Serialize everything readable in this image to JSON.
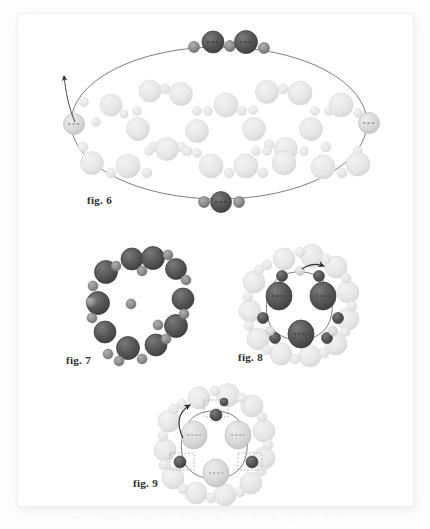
{
  "document": {
    "type": "scanned-figure-page",
    "page_background": "#ffffff",
    "page_border": "#efefef",
    "shadow_color": "#e9e9e9"
  },
  "palette": {
    "dark_sphere": "#565656",
    "dark_sphere_edge": "#3c3c3c",
    "mid_sphere": "#8e8e8e",
    "light_sphere": "#d8d8d8",
    "light_sphere_edge": "#c2c2c2",
    "pale_sphere": "#eaeaea",
    "line": "#777777",
    "caption_color": "#2b2b2b",
    "dash": "#4a4a4a"
  },
  "figures": [
    {
      "id": "fig6",
      "caption": "fig. 6",
      "shape": "ellipse",
      "description": "Large ellipse outline with dark spheres at top and bottom on the perimeter, light spheres at left and right vertices, interior filled with many pale spheres, curved arrow entering at the left vertex.",
      "ellipse": {
        "cx": 218,
        "cy": 122,
        "rx": 148,
        "ry": 76
      },
      "perimeter_spheres": [
        {
          "x": 193,
          "y": 46,
          "r": 5.5,
          "tone": "mid",
          "dashed": false
        },
        {
          "x": 212,
          "y": 41,
          "r": 11,
          "tone": "dark",
          "dashed": true
        },
        {
          "x": 229,
          "y": 45,
          "r": 5.5,
          "tone": "mid",
          "dashed": false
        },
        {
          "x": 245,
          "y": 41,
          "r": 11.5,
          "tone": "dark",
          "dashed": true
        },
        {
          "x": 263,
          "y": 47,
          "r": 5.5,
          "tone": "mid",
          "dashed": false
        },
        {
          "x": 203,
          "y": 201,
          "r": 5.5,
          "tone": "mid",
          "dashed": false
        },
        {
          "x": 220,
          "y": 201,
          "r": 10.5,
          "tone": "dark",
          "dashed": true
        },
        {
          "x": 238,
          "y": 201,
          "r": 5.5,
          "tone": "mid",
          "dashed": false
        },
        {
          "x": 73,
          "y": 123,
          "r": 10.5,
          "tone": "light",
          "dashed": true
        },
        {
          "x": 368,
          "y": 122,
          "r": 10.5,
          "tone": "light",
          "dashed": true
        }
      ],
      "interior_spheres": [
        {
          "x": 110,
          "y": 104,
          "r": 11
        },
        {
          "x": 123,
          "y": 113,
          "r": 4
        },
        {
          "x": 136,
          "y": 110,
          "r": 4.5
        },
        {
          "x": 149,
          "y": 90,
          "r": 11
        },
        {
          "x": 164,
          "y": 88,
          "r": 5
        },
        {
          "x": 180,
          "y": 93,
          "r": 11.5
        },
        {
          "x": 196,
          "y": 110,
          "r": 4.5
        },
        {
          "x": 207,
          "y": 110,
          "r": 4.5
        },
        {
          "x": 225,
          "y": 104,
          "r": 12
        },
        {
          "x": 241,
          "y": 110,
          "r": 4.5
        },
        {
          "x": 252,
          "y": 109,
          "r": 4.5
        },
        {
          "x": 266,
          "y": 91,
          "r": 11.5
        },
        {
          "x": 282,
          "y": 88,
          "r": 5
        },
        {
          "x": 299,
          "y": 92,
          "r": 12
        },
        {
          "x": 314,
          "y": 110,
          "r": 4.5
        },
        {
          "x": 328,
          "y": 110,
          "r": 4.5
        },
        {
          "x": 340,
          "y": 104,
          "r": 12
        },
        {
          "x": 357,
          "y": 112,
          "r": 4.5
        },
        {
          "x": 137,
          "y": 128,
          "r": 11.5
        },
        {
          "x": 153,
          "y": 146,
          "r": 5
        },
        {
          "x": 196,
          "y": 130,
          "r": 11.5
        },
        {
          "x": 180,
          "y": 146,
          "r": 5
        },
        {
          "x": 253,
          "y": 128,
          "r": 11.5
        },
        {
          "x": 268,
          "y": 144,
          "r": 5
        },
        {
          "x": 310,
          "y": 128,
          "r": 11.5
        },
        {
          "x": 325,
          "y": 146,
          "r": 5
        },
        {
          "x": 82,
          "y": 146,
          "r": 5
        },
        {
          "x": 148,
          "y": 150,
          "r": 4.5
        },
        {
          "x": 166,
          "y": 148,
          "r": 11.5
        },
        {
          "x": 186,
          "y": 150,
          "r": 5
        },
        {
          "x": 196,
          "y": 152,
          "r": 4.5
        },
        {
          "x": 255,
          "y": 150,
          "r": 4.5
        },
        {
          "x": 266,
          "y": 150,
          "r": 4.5
        },
        {
          "x": 285,
          "y": 148,
          "r": 11.5
        },
        {
          "x": 303,
          "y": 150,
          "r": 4.5
        },
        {
          "x": 357,
          "y": 150,
          "r": 4.5
        },
        {
          "x": 91,
          "y": 162,
          "r": 11.5
        },
        {
          "x": 110,
          "y": 172,
          "r": 5
        },
        {
          "x": 127,
          "y": 165,
          "r": 12
        },
        {
          "x": 146,
          "y": 172,
          "r": 5
        },
        {
          "x": 210,
          "y": 165,
          "r": 12
        },
        {
          "x": 228,
          "y": 172,
          "r": 5
        },
        {
          "x": 245,
          "y": 165,
          "r": 12
        },
        {
          "x": 262,
          "y": 172,
          "r": 5
        },
        {
          "x": 283,
          "y": 162,
          "r": 12
        },
        {
          "x": 322,
          "y": 166,
          "r": 12
        },
        {
          "x": 341,
          "y": 172,
          "r": 5
        },
        {
          "x": 357,
          "y": 163,
          "r": 12
        },
        {
          "x": 95,
          "y": 121,
          "r": 4.5
        },
        {
          "x": 83,
          "y": 101,
          "r": 4.5
        }
      ],
      "arrow": {
        "from": [
          63,
          75
        ],
        "to": [
          74,
          122
        ]
      }
    },
    {
      "id": "fig7",
      "caption": "fig. 7",
      "shape": "ring",
      "description": "Single ring of alternating large dark spheres and small mid-gray spheres, no connecting line drawn.",
      "center": [
        131,
        303
      ],
      "radius": 47,
      "large_count": 9,
      "small_count": 11
    },
    {
      "id": "fig8",
      "caption": "fig. 8",
      "shape": "double-ring",
      "description": "Outer ring of pale light spheres; inner ring of dark spheres connected by a thin line, with three large dark shaded ellipsoids at the 10, 2 and 6 o'clock positions and a small arrow entering at the top.",
      "center": [
        300,
        303
      ],
      "outer_radius": 50,
      "inner_radius": 32,
      "large_inner_count": 3,
      "small_inner_count": 6,
      "arrow": {
        "from": [
          316,
          266
        ],
        "to": [
          300,
          272
        ]
      }
    },
    {
      "id": "fig9",
      "caption": "fig. 9",
      "shape": "double-ring",
      "description": "Outer ring of pale light spheres; inner ring with three large light-gray ellipsoids and three small dark spheres each enclosed in a dashed box, with a curved arrow at the top-left.",
      "center": [
        215,
        442
      ],
      "outer_radius": 50,
      "inner_radius": 32,
      "large_inner_count": 3,
      "small_inner_count": 3,
      "dashed_boxes": 3,
      "arrow": {
        "from": [
          180,
          408
        ],
        "to": [
          196,
          418
        ]
      }
    }
  ],
  "captions": {
    "fig6": {
      "text": "fig. 6",
      "x": 86,
      "y": 198
    },
    "fig7": {
      "text": "fig. 7",
      "x": 65,
      "y": 358
    },
    "fig8": {
      "text": "fig. 8",
      "x": 237,
      "y": 355
    },
    "fig9": {
      "text": "fig. 9",
      "x": 132,
      "y": 481
    }
  }
}
